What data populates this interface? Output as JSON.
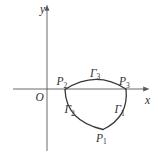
{
  "figure": {
    "colors": {
      "background": "#ffffff",
      "axis": "#5a5a5a",
      "curve": "#383838",
      "text": "#303030"
    },
    "axes": {
      "x_label": "x",
      "y_label": "y",
      "origin_label": "O"
    },
    "points": {
      "P1": {
        "base": "P",
        "sub": "1"
      },
      "P2": {
        "base": "P",
        "sub": "2"
      },
      "P3": {
        "base": "P",
        "sub": "3"
      }
    },
    "curves": {
      "Gamma1": {
        "base": "Γ",
        "sub": "1"
      },
      "Gamma2": {
        "base": "Γ",
        "sub": "2"
      },
      "Gamma3": {
        "base": "Γ",
        "sub": "3"
      }
    }
  }
}
